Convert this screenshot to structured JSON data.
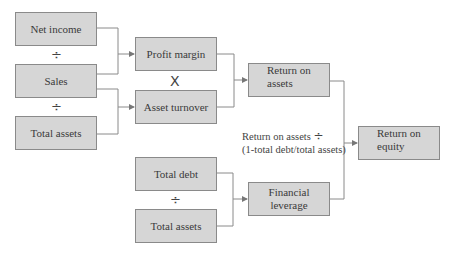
{
  "diagram": {
    "boxes": {
      "net_income": "Net income",
      "sales": "Sales",
      "total_assets_1": "Total assets",
      "profit_margin": "Profit margin",
      "asset_turnover": "Asset turnover",
      "return_on_assets_l1": "Return on",
      "return_on_assets_l2": "assets",
      "total_debt": "Total debt",
      "total_assets_2": "Total assets",
      "financial_leverage_l1": "Financial",
      "financial_leverage_l2": "leverage",
      "return_on_equity_l1": "Return on",
      "return_on_equity_l2": "equity"
    },
    "operators": {
      "divide_1": "÷",
      "divide_2": "÷",
      "multiply": "X",
      "divide_3": "÷"
    },
    "note": {
      "line1": "Return on assets",
      "line1_op": "÷",
      "line2": "(1-total debt/total assets)"
    },
    "colors": {
      "box_fill": "#d6d6d6",
      "box_border": "#8a8a8a",
      "line": "#8a8a8a"
    }
  }
}
